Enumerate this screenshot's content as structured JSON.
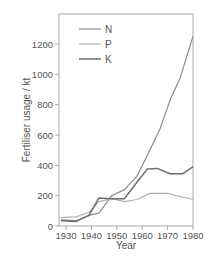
{
  "chart_data": {
    "type": "line",
    "title": "",
    "xlabel": "Year",
    "ylabel": "Fertiliser usage / kt",
    "xlim": [
      1928,
      1980
    ],
    "ylim": [
      0,
      1380
    ],
    "xticks": [
      1930,
      1940,
      1950,
      1960,
      1970,
      1980
    ],
    "yticks": [
      0,
      200,
      400,
      600,
      800,
      1000,
      1200
    ],
    "grid": false,
    "legend_position": "upper-left",
    "series": [
      {
        "name": "N",
        "color": "#8a8a8a",
        "width": 1.2,
        "x": [
          1928,
          1934,
          1939,
          1943,
          1948,
          1953,
          1958,
          1963,
          1967,
          1971,
          1975,
          1980
        ],
        "values": [
          40,
          35,
          70,
          85,
          200,
          240,
          330,
          500,
          640,
          830,
          980,
          1250
        ]
      },
      {
        "name": "P",
        "color": "#b0b0b0",
        "width": 1.2,
        "x": [
          1928,
          1934,
          1939,
          1943,
          1948,
          1953,
          1958,
          1963,
          1970,
          1980
        ],
        "values": [
          55,
          60,
          90,
          160,
          180,
          160,
          175,
          215,
          215,
          175
        ]
      },
      {
        "name": "K",
        "color": "#6e6e6e",
        "width": 1.5,
        "x": [
          1928,
          1934,
          1939,
          1943,
          1948,
          1953,
          1958,
          1962,
          1966,
          1971,
          1976,
          1980
        ],
        "values": [
          35,
          30,
          70,
          185,
          180,
          180,
          290,
          375,
          380,
          345,
          345,
          390
        ]
      }
    ]
  }
}
